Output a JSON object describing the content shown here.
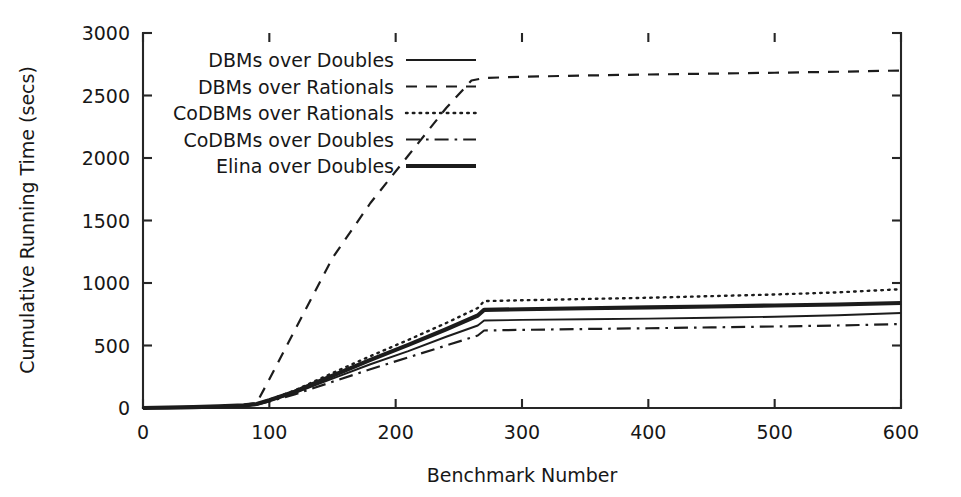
{
  "chart_data": {
    "type": "line",
    "title": "",
    "xlabel": "Benchmark Number",
    "ylabel": "Cumulative Running Time (secs)",
    "xlim": [
      0,
      600
    ],
    "ylim": [
      0,
      3000
    ],
    "xticks": [
      0,
      100,
      200,
      300,
      400,
      500,
      600
    ],
    "yticks": [
      0,
      500,
      1000,
      1500,
      2000,
      2500,
      3000
    ],
    "xtick_labels": [
      "0",
      "100",
      "200",
      "300",
      "400",
      "500",
      "600"
    ],
    "ytick_labels": [
      "0",
      "500",
      "1000",
      "1500",
      "2000",
      "2500",
      "3000"
    ],
    "grid": false,
    "legend_position": "upper-left-inside",
    "series": [
      {
        "name": "DBMs over Doubles",
        "style": "solid",
        "color": "#1c1c1c",
        "x": [
          0,
          20,
          40,
          60,
          80,
          90,
          100,
          120,
          150,
          180,
          210,
          240,
          265,
          270,
          300,
          350,
          400,
          450,
          500,
          550,
          600
        ],
        "y": [
          0,
          3,
          7,
          12,
          20,
          30,
          58,
          120,
          235,
          350,
          455,
          570,
          660,
          700,
          705,
          710,
          715,
          722,
          730,
          742,
          760
        ]
      },
      {
        "name": "DBMs over Rationals",
        "style": "dashed",
        "color": "#1c1c1c",
        "x": [
          0,
          20,
          40,
          60,
          80,
          90,
          100,
          120,
          150,
          180,
          210,
          240,
          260,
          270,
          300,
          350,
          400,
          450,
          500,
          550,
          600
        ],
        "y": [
          0,
          4,
          9,
          16,
          26,
          40,
          230,
          620,
          1200,
          1640,
          2020,
          2400,
          2620,
          2640,
          2650,
          2660,
          2668,
          2675,
          2682,
          2690,
          2700
        ]
      },
      {
        "name": "CoDBMs over Rationals",
        "style": "dotted",
        "color": "#1c1c1c",
        "x": [
          0,
          20,
          40,
          60,
          80,
          90,
          100,
          120,
          150,
          180,
          210,
          240,
          265,
          270,
          300,
          350,
          400,
          450,
          500,
          550,
          600
        ],
        "y": [
          0,
          4,
          8,
          14,
          22,
          34,
          66,
          140,
          280,
          415,
          545,
          680,
          800,
          855,
          862,
          872,
          882,
          895,
          908,
          925,
          950
        ]
      },
      {
        "name": "CoDBMs over Doubles",
        "style": "dash-dot",
        "color": "#1c1c1c",
        "x": [
          0,
          20,
          40,
          60,
          80,
          90,
          100,
          120,
          150,
          180,
          210,
          240,
          265,
          270,
          300,
          350,
          400,
          450,
          500,
          550,
          600
        ],
        "y": [
          0,
          3,
          6,
          11,
          18,
          28,
          52,
          108,
          210,
          310,
          405,
          500,
          580,
          620,
          625,
          632,
          638,
          645,
          652,
          660,
          672
        ]
      },
      {
        "name": "Elina over Doubles",
        "style": "solid-thick",
        "color": "#1c1c1c",
        "x": [
          0,
          20,
          40,
          60,
          80,
          90,
          100,
          120,
          150,
          180,
          210,
          240,
          265,
          270,
          300,
          350,
          400,
          450,
          500,
          550,
          600
        ],
        "y": [
          0,
          3,
          7,
          13,
          21,
          32,
          62,
          130,
          258,
          385,
          505,
          630,
          740,
          785,
          790,
          798,
          805,
          812,
          820,
          828,
          840
        ]
      }
    ]
  },
  "legend": {
    "entries": [
      {
        "label": "DBMs over Doubles",
        "style": "solid"
      },
      {
        "label": "DBMs over Rationals",
        "style": "dashed"
      },
      {
        "label": "CoDBMs over Rationals",
        "style": "dotted"
      },
      {
        "label": "CoDBMs over Doubles",
        "style": "dash-dot"
      },
      {
        "label": "Elina over Doubles",
        "style": "solid-thick"
      }
    ]
  }
}
